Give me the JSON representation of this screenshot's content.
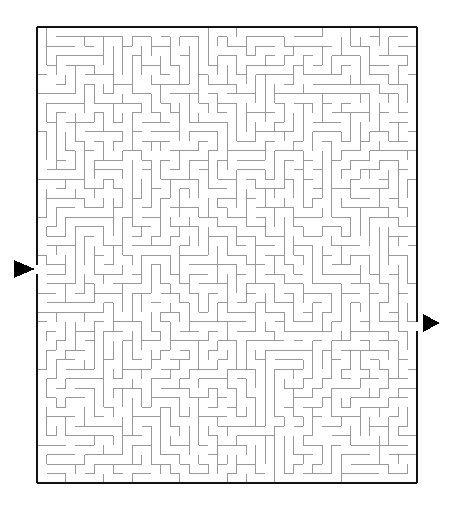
{
  "document": {
    "kind": "maze-puzzle",
    "title": "Maze",
    "background_color": "#ffffff"
  },
  "canvas": {
    "width": 460,
    "height": 515
  },
  "maze": {
    "origin_x": 37,
    "origin_y": 27,
    "cell_size": 9.5,
    "cols": 40,
    "rows": 48,
    "wall_color": "#9a9a9a",
    "wall_width": 1,
    "border_color": "#111111",
    "border_width": 2,
    "cell_fill": "#ffffff",
    "seed": 20250419
  },
  "entrance": {
    "label": "entrance",
    "side": "left",
    "row": 25,
    "marker_color": "#000000",
    "arrow_direction": "right",
    "arrow_tip_x": 35,
    "arrow_back_x": 14,
    "arrow_center_y": 269,
    "arrow_half_height": 9
  },
  "exit": {
    "label": "exit",
    "side": "right",
    "row": 31,
    "marker_color": "#000000",
    "arrow_direction": "right",
    "arrow_tip_x": 440,
    "arrow_back_x": 423,
    "arrow_center_y": 323,
    "arrow_half_height": 9
  },
  "legend": {
    "entrance_text": "",
    "exit_text": "",
    "title_text": ""
  }
}
